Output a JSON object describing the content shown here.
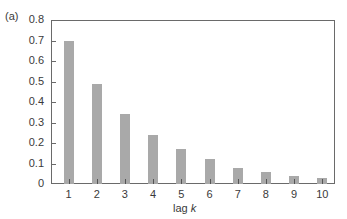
{
  "panel_label": "(a)",
  "chart_data": {
    "type": "bar",
    "title": "",
    "xlabel": "lag k",
    "ylabel": "",
    "categories": [
      "1",
      "2",
      "3",
      "4",
      "5",
      "6",
      "7",
      "8",
      "9",
      "10"
    ],
    "values": [
      0.7,
      0.49,
      0.34,
      0.24,
      0.17,
      0.12,
      0.08,
      0.06,
      0.04,
      0.03
    ],
    "ylim": [
      0,
      0.8
    ],
    "yticks": [
      "0",
      "0.1",
      "0.2",
      "0.3",
      "0.4",
      "0.5",
      "0.6",
      "0.7",
      "0.8"
    ],
    "grid": false,
    "legend": null,
    "bar_color": "#a9a9a9",
    "axis_color": "#6a6a6a"
  },
  "axis": {
    "xlabel_prefix": "lag ",
    "xlabel_var": "k"
  }
}
